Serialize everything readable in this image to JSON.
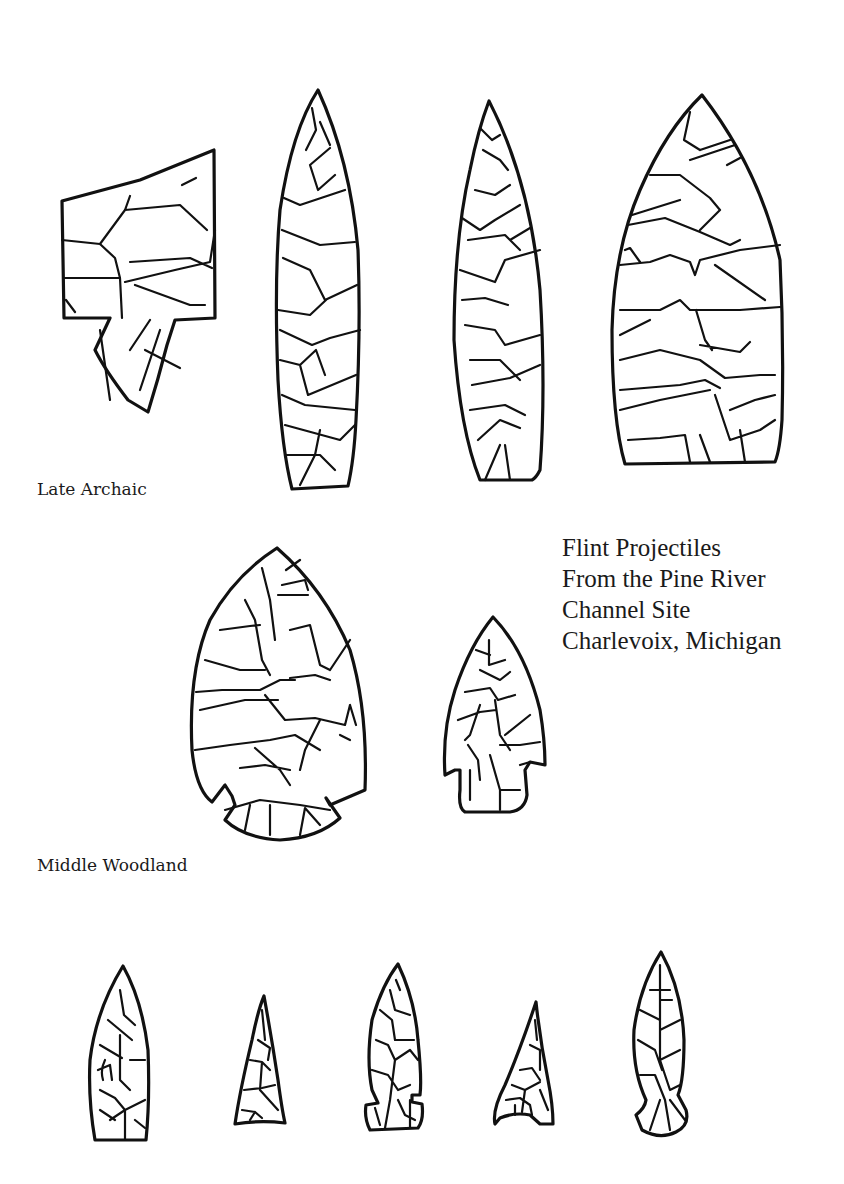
{
  "title": {
    "lines": [
      "Flint Projectiles",
      "From the Pine River",
      "Channel Site",
      "Charlevoix, Michigan"
    ]
  },
  "sections": [
    {
      "label": "Late Archaic",
      "artifact_count": 4
    },
    {
      "label": "Middle Woodland",
      "artifact_count": 2
    },
    {
      "label": "",
      "artifact_count": 5
    }
  ],
  "colors": {
    "background": "#ffffff",
    "ink": "#111111"
  }
}
